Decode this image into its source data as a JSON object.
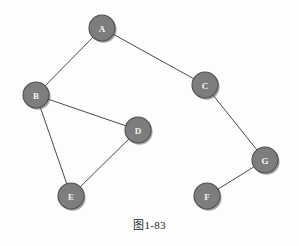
{
  "figure": {
    "caption": "图1-83",
    "background_color": "#fdfdfb",
    "node_fill_color": "#7d7d7d",
    "node_border_color": "#4f4f4f",
    "node_label_color": "#f4f4f2",
    "edge_color": "#4a4a4a",
    "node_radius": 13
  },
  "chart_data": {
    "type": "diagram",
    "title": "图1-83",
    "graph_kind": "undirected-graph",
    "nodes": [
      {
        "id": "A",
        "label": "A",
        "x": 102,
        "y": 28
      },
      {
        "id": "B",
        "label": "B",
        "x": 36,
        "y": 95
      },
      {
        "id": "C",
        "label": "C",
        "x": 205,
        "y": 85
      },
      {
        "id": "D",
        "label": "D",
        "x": 138,
        "y": 130
      },
      {
        "id": "E",
        "label": "E",
        "x": 71,
        "y": 196
      },
      {
        "id": "F",
        "label": "F",
        "x": 207,
        "y": 196
      },
      {
        "id": "G",
        "label": "G",
        "x": 265,
        "y": 160
      }
    ],
    "edges": [
      {
        "from": "A",
        "to": "B"
      },
      {
        "from": "A",
        "to": "C"
      },
      {
        "from": "B",
        "to": "D"
      },
      {
        "from": "B",
        "to": "E"
      },
      {
        "from": "D",
        "to": "E"
      },
      {
        "from": "C",
        "to": "G"
      },
      {
        "from": "G",
        "to": "F"
      }
    ],
    "node_count": 7,
    "edge_count": 7,
    "xlim": [
      0,
      299
    ],
    "ylim": [
      0,
      246
    ],
    "grid": false,
    "legend": false
  }
}
